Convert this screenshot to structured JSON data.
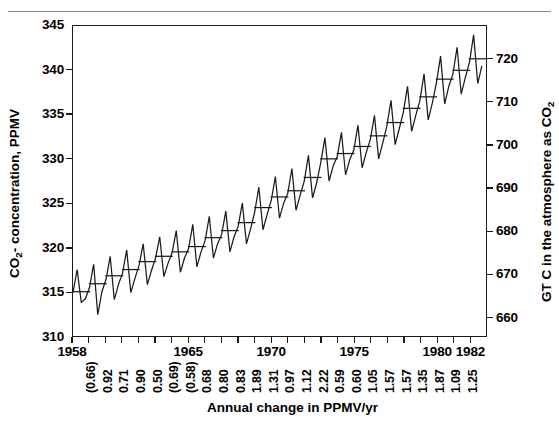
{
  "figure": {
    "top_rule": "decorative-rule"
  },
  "chart_data": {
    "type": "line",
    "title": "",
    "subtitle": "",
    "xlabel": "Annual change in PPMV/yr",
    "ylabel": "CO2- concentration, PPMV",
    "ylabel_right": "GT C in the atmosphere as CO2",
    "grid": false,
    "legend": "none",
    "xlim": [
      1958,
      1983
    ],
    "ylim": [
      310,
      345
    ],
    "ylim_right": [
      655.5,
      727.8
    ],
    "yticks": [
      310,
      315,
      320,
      325,
      330,
      335,
      340,
      345
    ],
    "yticks_right": [
      660,
      670,
      680,
      690,
      700,
      710,
      720
    ],
    "xticks": [
      1958,
      1959,
      1960,
      1961,
      1962,
      1963,
      1964,
      1965,
      1966,
      1967,
      1968,
      1969,
      1970,
      1971,
      1972,
      1973,
      1974,
      1975,
      1976,
      1977,
      1978,
      1979,
      1980,
      1981,
      1982
    ],
    "xtick_labels_shown": [
      {
        "year": 1958,
        "label": "1958"
      },
      {
        "year": 1965,
        "label": "1965"
      },
      {
        "year": 1970,
        "label": "1970"
      },
      {
        "year": 1975,
        "label": "1975"
      },
      {
        "year": 1980,
        "label": "1980"
      },
      {
        "year": 1982,
        "label": "1982"
      }
    ],
    "annual_change_labels": [
      "(0.66)",
      "0.92",
      "0.71",
      "0.90",
      "0.50",
      "(0.69)",
      "(0.58)",
      "0.68",
      "0.80",
      "0.83",
      "1.89",
      "1.31",
      "0.97",
      "1.12",
      "2.22",
      "0.59",
      "0.60",
      "1.05",
      "1.57",
      "1.57",
      "1.35",
      "1.87",
      "1.09",
      "1.25"
    ],
    "annual_change_years": [
      1959,
      1960,
      1961,
      1962,
      1963,
      1964,
      1965,
      1966,
      1967,
      1968,
      1969,
      1970,
      1971,
      1972,
      1973,
      1974,
      1975,
      1976,
      1977,
      1978,
      1979,
      1980,
      1981,
      1982
    ],
    "series": [
      {
        "name": "Monthly CO2 concentration (Mauna Loa)",
        "color": "#1a1a1a",
        "x": [
          1958.0,
          1958.25,
          1958.5,
          1958.75,
          1959.0,
          1959.25,
          1959.5,
          1959.75,
          1960.0,
          1960.25,
          1960.5,
          1960.75,
          1961.0,
          1961.25,
          1961.5,
          1961.75,
          1962.0,
          1962.25,
          1962.5,
          1962.75,
          1963.0,
          1963.25,
          1963.5,
          1963.75,
          1964.0,
          1964.25,
          1964.5,
          1964.75,
          1965.0,
          1965.25,
          1965.5,
          1965.75,
          1966.0,
          1966.25,
          1966.5,
          1966.75,
          1967.0,
          1967.25,
          1967.5,
          1967.75,
          1968.0,
          1968.25,
          1968.5,
          1968.75,
          1969.0,
          1969.25,
          1969.5,
          1969.75,
          1970.0,
          1970.25,
          1970.5,
          1970.75,
          1971.0,
          1971.25,
          1971.5,
          1971.75,
          1972.0,
          1972.25,
          1972.5,
          1972.75,
          1973.0,
          1973.25,
          1973.5,
          1973.75,
          1974.0,
          1974.25,
          1974.5,
          1974.75,
          1975.0,
          1975.25,
          1975.5,
          1975.75,
          1976.0,
          1976.25,
          1976.5,
          1976.75,
          1977.0,
          1977.25,
          1977.5,
          1977.75,
          1978.0,
          1978.25,
          1978.5,
          1978.75,
          1979.0,
          1979.25,
          1979.5,
          1979.75,
          1980.0,
          1980.25,
          1980.5,
          1980.75,
          1981.0,
          1981.25,
          1981.5,
          1981.75,
          1982.0,
          1982.25,
          1982.5,
          1982.75
        ],
        "y": [
          314.9,
          317.5,
          313.8,
          314.2,
          315.5,
          318.1,
          312.4,
          315.0,
          316.4,
          319.0,
          314.1,
          315.8,
          317.1,
          319.7,
          314.9,
          316.5,
          318.0,
          320.4,
          315.8,
          317.4,
          318.8,
          321.2,
          316.7,
          318.2,
          319.4,
          321.9,
          317.2,
          318.8,
          319.9,
          322.6,
          317.8,
          319.5,
          320.8,
          323.5,
          318.8,
          320.4,
          321.5,
          324.1,
          319.5,
          321.2,
          322.4,
          325.0,
          320.4,
          322.1,
          324.0,
          326.8,
          322.0,
          323.7,
          325.3,
          328.0,
          323.3,
          325.0,
          326.1,
          328.9,
          324.2,
          325.9,
          327.5,
          330.4,
          325.6,
          327.3,
          329.6,
          332.4,
          327.5,
          329.2,
          330.3,
          333.0,
          328.2,
          329.9,
          331.0,
          333.8,
          329.0,
          330.7,
          332.2,
          334.9,
          330.0,
          331.8,
          333.7,
          336.6,
          331.6,
          333.4,
          335.3,
          338.2,
          333.1,
          334.9,
          336.6,
          339.6,
          334.4,
          336.3,
          338.6,
          341.6,
          336.2,
          338.2,
          339.6,
          342.6,
          337.3,
          339.2,
          340.9,
          344.0,
          338.5,
          340.5
        ]
      }
    ],
    "annual_mean_markers": {
      "name": "Annual mean tick segments",
      "years": [
        1958,
        1959,
        1960,
        1961,
        1962,
        1963,
        1964,
        1965,
        1966,
        1967,
        1968,
        1969,
        1970,
        1971,
        1972,
        1973,
        1974,
        1975,
        1976,
        1977,
        1978,
        1979,
        1980,
        1981,
        1982
      ],
      "values": [
        315.0,
        315.9,
        316.8,
        317.5,
        318.4,
        319.0,
        319.5,
        320.1,
        321.1,
        321.9,
        322.8,
        324.5,
        325.7,
        326.4,
        327.9,
        330.0,
        330.6,
        331.4,
        332.6,
        334.1,
        335.7,
        337.0,
        339.0,
        340.0,
        341.3
      ]
    }
  }
}
